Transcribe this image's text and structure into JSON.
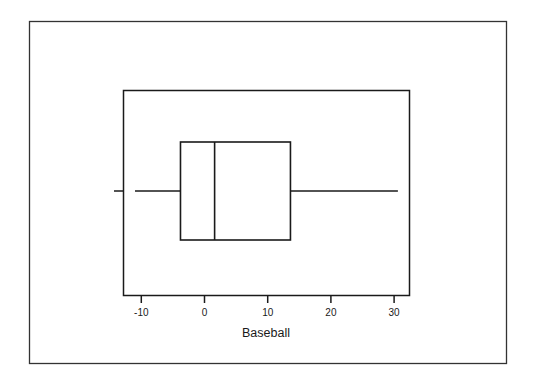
{
  "chart_data": {
    "type": "boxplot",
    "title": "",
    "xlabel": "Baseball",
    "ylabel": "",
    "orientation": "horizontal",
    "xlim": [
      -13,
      32
    ],
    "ticks": [
      -10,
      0,
      10,
      20,
      30
    ],
    "tick_labels": [
      "-10",
      "0",
      "10",
      "20",
      "30"
    ],
    "grid": false,
    "legend": null,
    "series": [
      {
        "name": "Baseball",
        "whisker_low": -11,
        "q1": -3.8,
        "median": 1.6,
        "q3": 13.6,
        "whisker_high": 30.6
      }
    ]
  },
  "colors": {
    "background": "#ffffff",
    "line": "#1a1a1a"
  }
}
